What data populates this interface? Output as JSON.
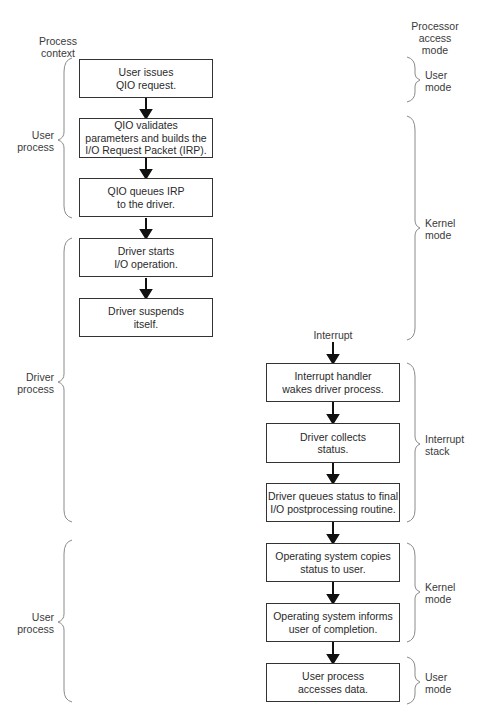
{
  "headers": {
    "process_context": "Process\ncontext",
    "processor_access_mode": "Processor\naccess\nmode"
  },
  "left_braces": [
    {
      "label": "User\nprocess"
    },
    {
      "label": "Driver\nprocess"
    },
    {
      "label": "User\nprocess"
    }
  ],
  "right_braces": [
    {
      "label": "User\nmode"
    },
    {
      "label": "Kernel\nmode"
    },
    {
      "label": "Interrupt\nstack"
    },
    {
      "label": "Kernel\nmode"
    },
    {
      "label": "User\nmode"
    }
  ],
  "interrupt_label": "Interrupt",
  "steps": [
    {
      "text": "User issues\nQIO request."
    },
    {
      "text": "QIO validates\nparameters and builds the\nI/O Request Packet (IRP)."
    },
    {
      "text": "QIO queues IRP\nto the driver."
    },
    {
      "text": "Driver starts\nI/O operation."
    },
    {
      "text": "Driver suspends\nitself."
    },
    {
      "text": "Interrupt  handler\nwakes driver process."
    },
    {
      "text": "Driver collects\nstatus."
    },
    {
      "text": "Driver queues status to final\nI/O postprocessing routine."
    },
    {
      "text": "Operating system copies\nstatus to user."
    },
    {
      "text": "Operating system informs\nuser of completion."
    },
    {
      "text": "User process\naccesses data."
    }
  ]
}
